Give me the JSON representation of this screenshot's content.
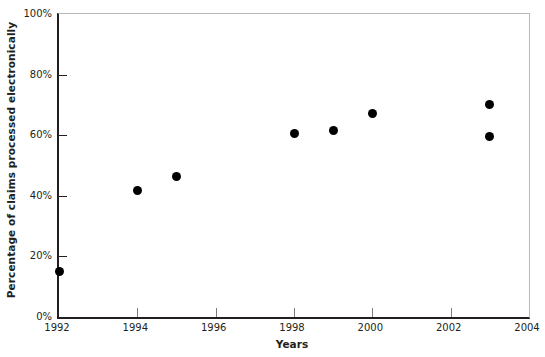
{
  "chart_data": {
    "type": "scatter",
    "title": "",
    "xlabel": "Years",
    "ylabel": "Percentage of claims processed electronically",
    "xlim": [
      1992,
      2004
    ],
    "ylim": [
      0,
      100
    ],
    "grid": false,
    "legend": "none",
    "marker": {
      "shape": "circle",
      "color": "#000000",
      "size_px": 9
    },
    "x_ticks": [
      1992,
      1994,
      1996,
      1998,
      2000,
      2002,
      2004
    ],
    "x_tick_labels": [
      "1992",
      "1994",
      "1996",
      "1998",
      "2000",
      "2002",
      "2004"
    ],
    "y_ticks": [
      0,
      20,
      40,
      60,
      80,
      100
    ],
    "y_tick_labels": [
      "0%",
      "20%",
      "40%",
      "60%",
      "80%",
      "100%"
    ],
    "x": [
      1992,
      1994,
      1995,
      1998,
      1999,
      2000,
      2003,
      2003
    ],
    "y": [
      15,
      41.6,
      46.5,
      60.5,
      61.5,
      67,
      70,
      59.5
    ],
    "points": [
      {
        "x": 1992,
        "y": 15
      },
      {
        "x": 1994,
        "y": 41.6
      },
      {
        "x": 1995,
        "y": 46.5
      },
      {
        "x": 1998,
        "y": 60.5
      },
      {
        "x": 1999,
        "y": 61.5
      },
      {
        "x": 2000,
        "y": 67
      },
      {
        "x": 2003,
        "y": 70
      },
      {
        "x": 2003,
        "y": 59.5
      }
    ],
    "colors": {
      "marker": "#000000",
      "axis": "#231f20",
      "frame": "#b8b8b8",
      "background": "#ffffff"
    }
  }
}
